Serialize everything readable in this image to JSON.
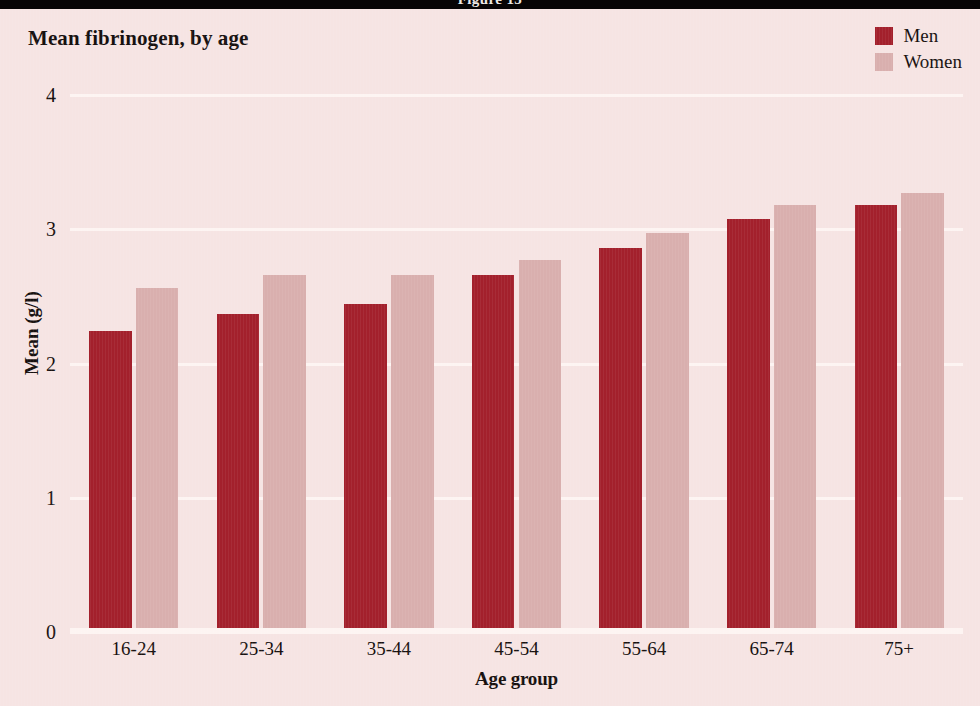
{
  "banner": {
    "caption": "Figure 15"
  },
  "chart_title": "Mean fibrinogen, by age",
  "legend": {
    "position": "top-right",
    "entries": [
      {
        "label": "Men",
        "color": "#a3202c",
        "icon": "legend-swatch-icon"
      },
      {
        "label": "Women",
        "color": "#d9afae",
        "icon": "legend-swatch-icon"
      }
    ]
  },
  "colors": {
    "background": "#f6e4e3",
    "men": "#a3202c",
    "women": "#d9afae",
    "gridline": "#fdf4f2",
    "text": "#16100f",
    "banner": "#070405"
  },
  "chart_data": {
    "type": "bar",
    "title": "Mean fibrinogen, by age",
    "xlabel": "Age group",
    "ylabel": "Mean (g/l)",
    "categories": [
      "16-24",
      "25-34",
      "35-44",
      "45-54",
      "55-64",
      "65-74",
      "75+"
    ],
    "series": [
      {
        "name": "Men",
        "color": "#a3202c",
        "values": [
          2.24,
          2.37,
          2.44,
          2.66,
          2.86,
          3.08,
          3.18
        ]
      },
      {
        "name": "Women",
        "color": "#d9afae",
        "values": [
          2.56,
          2.66,
          2.66,
          2.77,
          2.97,
          3.18,
          3.27
        ]
      }
    ],
    "ylim": [
      0,
      4
    ],
    "yticks": [
      0,
      1,
      2,
      3,
      4
    ],
    "ytick_labels": [
      "0",
      "1",
      "2",
      "3",
      "4"
    ],
    "grid": true,
    "grid_axis": "y",
    "legend_position": "top-right"
  }
}
